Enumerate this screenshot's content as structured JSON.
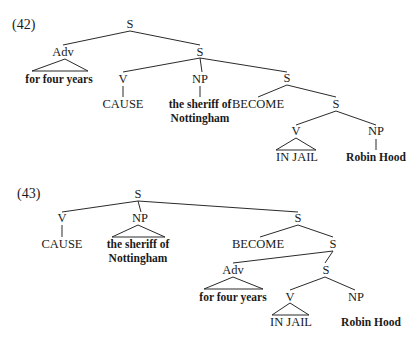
{
  "examples": [
    {
      "number": "(42)",
      "nodes": {
        "root": "S",
        "adv": "Adv",
        "adv_text": "for four years",
        "s1": "S",
        "v": "V",
        "v_text": "CAUSE",
        "np": "NP",
        "np_text_1": "the sheriff of",
        "np_text_2": "Nottingham",
        "s2": "S",
        "become": "BECOME",
        "s3": "S",
        "v2": "V",
        "v2_text": "IN JAIL",
        "np2": "NP",
        "np2_text": "Robin Hood"
      }
    },
    {
      "number": "(43)",
      "nodes": {
        "root": "S",
        "v": "V",
        "v_text": "CAUSE",
        "np": "NP",
        "np_text_1": "the sheriff of",
        "np_text_2": "Nottingham",
        "s1": "S",
        "become": "BECOME",
        "s2": "S",
        "adv": "Adv",
        "adv_text": "for four years",
        "s3": "S",
        "v2": "V",
        "v2_text": "IN JAIL",
        "np2": "NP",
        "np2_text": "Robin Hood"
      }
    }
  ]
}
